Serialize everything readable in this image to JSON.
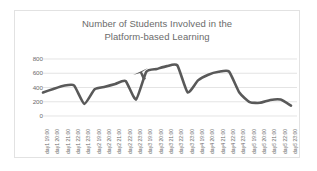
{
  "chart_data": {
    "type": "line",
    "title": "Number of Students Involved in the Platform-based Learning",
    "title_lines": [
      "Number of Students Involved in the",
      "Platform-based Learning"
    ],
    "xlabel": "",
    "ylabel": "",
    "ylim": [
      0,
      800
    ],
    "yticks": [
      800,
      600,
      400,
      200,
      0
    ],
    "ytick_labels": [
      "800",
      "600",
      "400",
      "200",
      "0"
    ],
    "grid": true,
    "legend": false,
    "legend_position": "none",
    "line_color": "#595959",
    "grid_color": "#d9d9d9",
    "text_color": "#6b6b6b",
    "categories": [
      "day1 19:00",
      "day1 20:00",
      "day1 21:00",
      "day1 22:00",
      "day1 23:00",
      "day2 19:00",
      "day2 20:00",
      "day2 21:00",
      "day2 22:00",
      "day2 23:00",
      "day3 19:00",
      "day3 20:00",
      "day3 21:00",
      "day3 22:00",
      "day3 23:00",
      "day4 19:00",
      "day4 20:00",
      "day4 21:00",
      "day4 22:00",
      "day4 23:00",
      "day5 19:00",
      "day5 20:00",
      "day5 21:00",
      "day5 22:00",
      "day5 23:00"
    ],
    "values": [
      330,
      380,
      425,
      430,
      170,
      375,
      410,
      450,
      490,
      230,
      620,
      660,
      700,
      710,
      330,
      500,
      580,
      620,
      625,
      330,
      195,
      185,
      225,
      230,
      145
    ]
  },
  "artifacts": {
    "cursor_arrow": "mouse-cursor-arrow"
  }
}
